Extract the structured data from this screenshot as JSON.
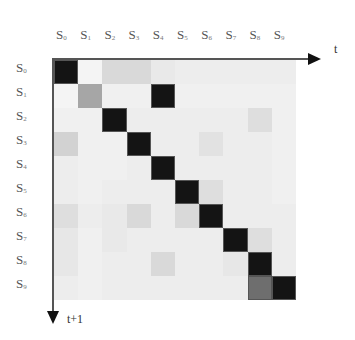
{
  "diagram": {
    "title": "",
    "states": [
      "S0",
      "S1",
      "S2",
      "S3",
      "S4",
      "S5",
      "S6",
      "S7",
      "S8",
      "S9"
    ],
    "x_axis_label": "t",
    "y_axis_label": "t+1",
    "matrix_intensity": [
      [
        1.0,
        0.0,
        0.12,
        0.12,
        0.05,
        0.03,
        0.03,
        0.03,
        0.03,
        0.03
      ],
      [
        0.0,
        0.35,
        0.02,
        0.02,
        1.0,
        0.02,
        0.02,
        0.02,
        0.02,
        0.02
      ],
      [
        0.02,
        0.02,
        1.0,
        0.03,
        0.03,
        0.03,
        0.03,
        0.03,
        0.1,
        0.02
      ],
      [
        0.15,
        0.02,
        0.02,
        1.0,
        0.03,
        0.03,
        0.08,
        0.03,
        0.03,
        0.02
      ],
      [
        0.03,
        0.02,
        0.02,
        0.03,
        1.0,
        0.03,
        0.03,
        0.03,
        0.03,
        0.02
      ],
      [
        0.03,
        0.02,
        0.03,
        0.03,
        0.03,
        1.0,
        0.1,
        0.03,
        0.03,
        0.02
      ],
      [
        0.1,
        0.03,
        0.05,
        0.12,
        0.03,
        0.12,
        1.0,
        0.03,
        0.03,
        0.03
      ],
      [
        0.06,
        0.02,
        0.05,
        0.03,
        0.03,
        0.03,
        0.03,
        1.0,
        0.1,
        0.03
      ],
      [
        0.06,
        0.02,
        0.03,
        0.03,
        0.12,
        0.03,
        0.03,
        0.06,
        1.0,
        0.03
      ],
      [
        0.03,
        0.02,
        0.03,
        0.03,
        0.03,
        0.03,
        0.03,
        0.03,
        0.6,
        1.0
      ]
    ]
  },
  "labels": {
    "cols": [
      {
        "s": "S",
        "n": "0"
      },
      {
        "s": "S",
        "n": "1"
      },
      {
        "s": "S",
        "n": "2"
      },
      {
        "s": "S",
        "n": "3"
      },
      {
        "s": "S",
        "n": "4"
      },
      {
        "s": "S",
        "n": "5"
      },
      {
        "s": "S",
        "n": "6"
      },
      {
        "s": "S",
        "n": "7"
      },
      {
        "s": "S",
        "n": "8"
      },
      {
        "s": "S",
        "n": "9"
      }
    ],
    "x_axis": "t",
    "y_axis": "t+1"
  }
}
